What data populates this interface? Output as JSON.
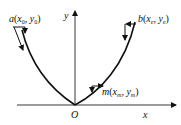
{
  "diagram": {
    "axes": {
      "x_label": "x",
      "y_label": "y",
      "origin_label": "O"
    },
    "points": {
      "a": {
        "name": "a",
        "x_sym": "x",
        "x_sub": "0",
        "y_sym": "y",
        "y_sub": "0"
      },
      "b": {
        "name": "b",
        "x_sym": "x",
        "x_sub": "e",
        "y_sym": "y",
        "y_sub": "e"
      },
      "m": {
        "name": "m",
        "x_sym": "x",
        "x_sub": "m",
        "y_sym": "y",
        "y_sub": "m"
      }
    },
    "colors": {
      "stroke": "#111111",
      "background": "#ffffff"
    }
  }
}
